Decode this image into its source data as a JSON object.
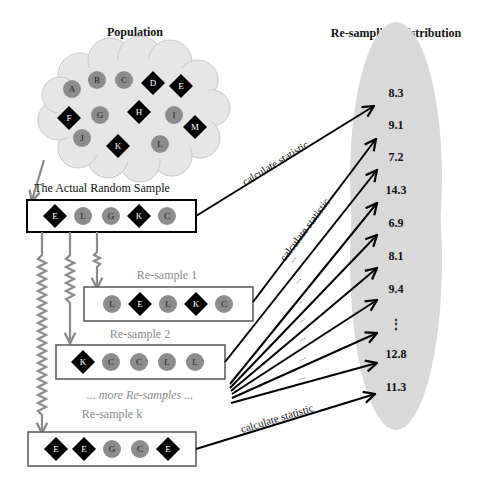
{
  "titles": {
    "population": "Population",
    "actual_sample": "The Actual Random Sample",
    "distribution": "Re-sampling Distribution"
  },
  "population_items": [
    {
      "label": "A",
      "shape": "circle",
      "x": 72,
      "y": 89
    },
    {
      "label": "B",
      "shape": "circle",
      "x": 97,
      "y": 80
    },
    {
      "label": "C",
      "shape": "circle",
      "x": 124,
      "y": 80
    },
    {
      "label": "D",
      "shape": "diamond",
      "x": 153,
      "y": 83
    },
    {
      "label": "E",
      "shape": "diamond",
      "x": 181,
      "y": 86
    },
    {
      "label": "F",
      "shape": "diamond",
      "x": 69,
      "y": 118
    },
    {
      "label": "G",
      "shape": "circle",
      "x": 100,
      "y": 115
    },
    {
      "label": "H",
      "shape": "diamond",
      "x": 139,
      "y": 112
    },
    {
      "label": "I",
      "shape": "circle",
      "x": 174,
      "y": 115
    },
    {
      "label": "J",
      "shape": "circle",
      "x": 82,
      "y": 138
    },
    {
      "label": "K",
      "shape": "diamond",
      "x": 118,
      "y": 146
    },
    {
      "label": "L",
      "shape": "circle",
      "x": 160,
      "y": 144
    },
    {
      "label": "M",
      "shape": "diamond",
      "x": 195,
      "y": 127
    }
  ],
  "actual_sample": {
    "items": [
      {
        "label": "E",
        "shape": "diamond"
      },
      {
        "label": "L",
        "shape": "circle"
      },
      {
        "label": "G",
        "shape": "circle"
      },
      {
        "label": "K",
        "shape": "diamond"
      },
      {
        "label": "C",
        "shape": "circle"
      }
    ]
  },
  "resamples": [
    {
      "title": "Re-sample 1",
      "items": [
        {
          "label": "L",
          "shape": "circle"
        },
        {
          "label": "E",
          "shape": "diamond"
        },
        {
          "label": "L",
          "shape": "circle"
        },
        {
          "label": "K",
          "shape": "diamond"
        },
        {
          "label": "C",
          "shape": "circle"
        }
      ]
    },
    {
      "title": "Re-sample 2",
      "items": [
        {
          "label": "K",
          "shape": "diamond"
        },
        {
          "label": "C",
          "shape": "circle"
        },
        {
          "label": "C",
          "shape": "circle"
        },
        {
          "label": "L",
          "shape": "circle"
        },
        {
          "label": "L",
          "shape": "circle"
        }
      ]
    },
    {
      "title": "Re-sample k",
      "items": [
        {
          "label": "E",
          "shape": "diamond"
        },
        {
          "label": "E",
          "shape": "diamond"
        },
        {
          "label": "G",
          "shape": "circle"
        },
        {
          "label": "C",
          "shape": "circle"
        },
        {
          "label": "E",
          "shape": "diamond"
        }
      ]
    }
  ],
  "more_resamples_label": "... more Re-samples ...",
  "calculate_label": "calculate statistic",
  "ellipsis_label": "...",
  "distribution_values": [
    "8.3",
    "9.1",
    "7.2",
    "14.3",
    "6.9",
    "8.1",
    "9.4",
    "⋮",
    "12.8",
    "11.3"
  ],
  "colors": {
    "circle_fill": "#8c8c8c",
    "diamond_fill": "#000000",
    "cloud_fill": "#e6e6e6",
    "ellipse_fill": "#d9d9d9",
    "gray_arrow": "#8a8a8a"
  }
}
